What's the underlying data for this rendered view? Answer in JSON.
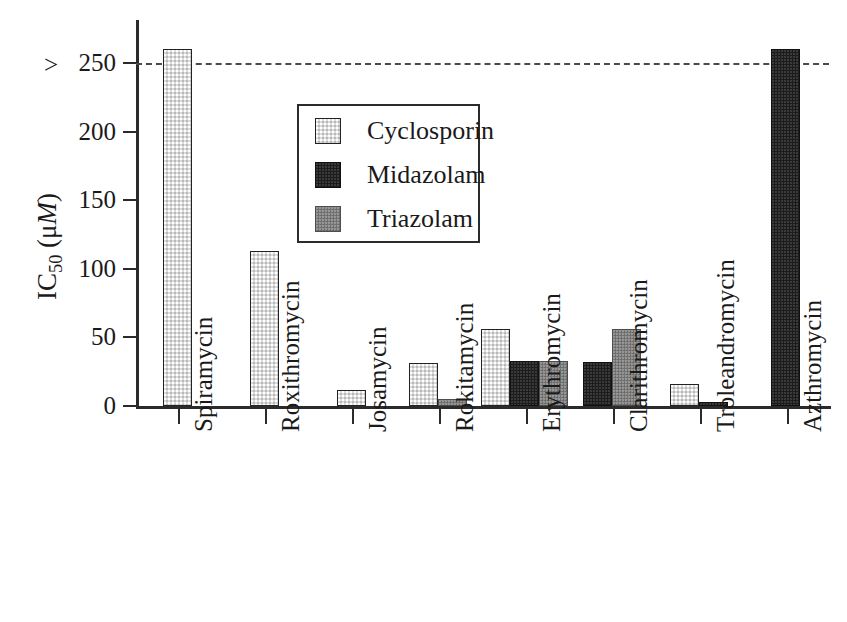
{
  "chart_data": {
    "type": "bar",
    "title": "",
    "subtitle": "",
    "xlabel": "",
    "ylabel": "IC50 (uM)",
    "ylabel_parts": {
      "prefix": "IC",
      "subscript": "50",
      "unit_open": " (μ",
      "unit_italic": "M",
      "unit_close": ")"
    },
    "ylim": [
      0,
      270
    ],
    "yticks": [
      0,
      50,
      100,
      150,
      200,
      250
    ],
    "ytick_labels": [
      "0",
      "50",
      "100",
      "150",
      "200",
      "250"
    ],
    "grid": false,
    "legend_position": "upper-center",
    "categories": [
      "Spiramycin",
      "Roxithromycin",
      "Josamycin",
      "Rokitamycin",
      "Erythromycin",
      "Clarithromycin",
      "Troleandromycin",
      "Azthromycin"
    ],
    "series": [
      {
        "name": "Cyclosporin",
        "key": "cyclosporin",
        "color": "#dcdcdc",
        "values": [
          260,
          113,
          12,
          31,
          56,
          null,
          16,
          null
        ]
      },
      {
        "name": "Midazolam",
        "key": "midazolam",
        "color": "#1c1c1c",
        "values": [
          null,
          null,
          null,
          null,
          33,
          32,
          3,
          260
        ]
      },
      {
        "name": "Triazolam",
        "key": "triazolam",
        "color": "#7d7d7d",
        "values": [
          null,
          null,
          null,
          5,
          33,
          56,
          null,
          null
        ]
      }
    ],
    "annotations": [
      {
        "name": "threshold-line",
        "type": "hline",
        "y": 250,
        "style": "dashed",
        "label": ""
      },
      {
        "name": "greater-than-marker",
        "type": "text",
        "text": ">",
        "y": 250,
        "x": "left-of-axis"
      }
    ]
  },
  "legend": {
    "entries": [
      {
        "label": "Cyclosporin",
        "key": "cyclosporin"
      },
      {
        "label": "Midazolam",
        "key": "midazolam"
      },
      {
        "label": "Triazolam",
        "key": "triazolam"
      }
    ]
  },
  "axis": {
    "gt_marker": ">",
    "y_title_prefix": "IC",
    "y_title_sub": "50",
    "y_title_unit_open": " (μ",
    "y_title_unit_italic": "M",
    "y_title_unit_close": ")"
  }
}
